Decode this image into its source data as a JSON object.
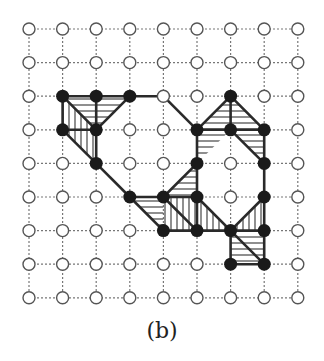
{
  "caption": "(b)",
  "grid": {
    "cols": 9,
    "rows": 9,
    "origin_x": 29,
    "origin_y": 29,
    "spacing": 33.6,
    "node_radius": 6.5
  },
  "colors": {
    "grid_line": "#777777",
    "open_node_stroke": "#555555",
    "filled_node": "#1a1a1a",
    "edge": "#2a2a2a",
    "hatch": "#333333"
  },
  "filled_nodes": [
    [
      1,
      2
    ],
    [
      2,
      2
    ],
    [
      3,
      2
    ],
    [
      6,
      2
    ],
    [
      1,
      3
    ],
    [
      2,
      3
    ],
    [
      5,
      3
    ],
    [
      6,
      3
    ],
    [
      7,
      3
    ],
    [
      2,
      4
    ],
    [
      5,
      4
    ],
    [
      7,
      4
    ],
    [
      3,
      5
    ],
    [
      4,
      5
    ],
    [
      5,
      5
    ],
    [
      7,
      5
    ],
    [
      4,
      6
    ],
    [
      5,
      6
    ],
    [
      6,
      6
    ],
    [
      7,
      6
    ],
    [
      6,
      7
    ],
    [
      7,
      7
    ]
  ],
  "edges": [
    [
      [
        1,
        2
      ],
      [
        2,
        2
      ]
    ],
    [
      [
        2,
        2
      ],
      [
        3,
        2
      ]
    ],
    [
      [
        3,
        2
      ],
      [
        4,
        2
      ]
    ],
    [
      [
        1,
        2
      ],
      [
        1,
        3
      ]
    ],
    [
      [
        2,
        2
      ],
      [
        2,
        3
      ]
    ],
    [
      [
        1,
        3
      ],
      [
        2,
        3
      ]
    ],
    [
      [
        2,
        3
      ],
      [
        2,
        4
      ]
    ],
    [
      [
        1,
        2
      ],
      [
        2,
        3
      ]
    ],
    [
      [
        3,
        2
      ],
      [
        2,
        3
      ]
    ],
    [
      [
        1,
        3
      ],
      [
        2,
        4
      ]
    ],
    [
      [
        4,
        2
      ],
      [
        5,
        3
      ]
    ],
    [
      [
        2,
        4
      ],
      [
        3,
        5
      ]
    ],
    [
      [
        5,
        3
      ],
      [
        6,
        2
      ]
    ],
    [
      [
        6,
        2
      ],
      [
        7,
        3
      ]
    ],
    [
      [
        6,
        2
      ],
      [
        6,
        3
      ]
    ],
    [
      [
        5,
        3
      ],
      [
        6,
        3
      ]
    ],
    [
      [
        6,
        3
      ],
      [
        7,
        3
      ]
    ],
    [
      [
        5,
        3
      ],
      [
        5,
        4
      ]
    ],
    [
      [
        6,
        3
      ],
      [
        7,
        4
      ]
    ],
    [
      [
        7,
        3
      ],
      [
        7,
        4
      ]
    ],
    [
      [
        5,
        4
      ],
      [
        4,
        5
      ]
    ],
    [
      [
        3,
        5
      ],
      [
        4,
        5
      ]
    ],
    [
      [
        4,
        5
      ],
      [
        5,
        5
      ]
    ],
    [
      [
        5,
        4
      ],
      [
        5,
        5
      ]
    ],
    [
      [
        3,
        5
      ],
      [
        4,
        6
      ]
    ],
    [
      [
        4,
        5
      ],
      [
        5,
        6
      ]
    ],
    [
      [
        4,
        6
      ],
      [
        5,
        6
      ]
    ],
    [
      [
        5,
        6
      ],
      [
        6,
        6
      ]
    ],
    [
      [
        5,
        5
      ],
      [
        6,
        6
      ]
    ],
    [
      [
        6,
        6
      ],
      [
        7,
        5
      ]
    ],
    [
      [
        7,
        4
      ],
      [
        7,
        5
      ]
    ],
    [
      [
        7,
        5
      ],
      [
        7,
        6
      ]
    ],
    [
      [
        6,
        6
      ],
      [
        7,
        6
      ]
    ],
    [
      [
        6,
        6
      ],
      [
        6,
        7
      ]
    ],
    [
      [
        6,
        6
      ],
      [
        7,
        7
      ]
    ],
    [
      [
        6,
        7
      ],
      [
        7,
        7
      ]
    ],
    [
      [
        7,
        6
      ],
      [
        7,
        7
      ]
    ],
    [
      [
        5,
        5
      ],
      [
        5,
        6
      ]
    ]
  ],
  "hatched_regions": [
    {
      "points": [
        [
          1,
          2
        ],
        [
          3,
          2
        ],
        [
          2,
          3
        ]
      ],
      "direction": "horizontal"
    },
    {
      "points": [
        [
          1,
          2
        ],
        [
          2,
          3
        ],
        [
          2,
          4
        ],
        [
          1,
          3
        ]
      ],
      "direction": "vertical"
    },
    {
      "points": [
        [
          6,
          2
        ],
        [
          5,
          3
        ],
        [
          6,
          3
        ]
      ],
      "direction": "horizontal"
    },
    {
      "points": [
        [
          6,
          2
        ],
        [
          6,
          3
        ],
        [
          7,
          3
        ]
      ],
      "direction": "horizontal"
    },
    {
      "points": [
        [
          5,
          3
        ],
        [
          6,
          3
        ],
        [
          5,
          4
        ]
      ],
      "direction": "horizontal"
    },
    {
      "points": [
        [
          6,
          3
        ],
        [
          7,
          3
        ],
        [
          7,
          4
        ]
      ],
      "direction": "horizontal"
    },
    {
      "points": [
        [
          5,
          4
        ],
        [
          5,
          5
        ],
        [
          4,
          5
        ]
      ],
      "direction": "horizontal"
    },
    {
      "points": [
        [
          3,
          5
        ],
        [
          4,
          5
        ],
        [
          4,
          6
        ]
      ],
      "direction": "horizontal"
    },
    {
      "points": [
        [
          4,
          5
        ],
        [
          5,
          5
        ],
        [
          5,
          6
        ],
        [
          4,
          6
        ]
      ],
      "direction": "vertical"
    },
    {
      "points": [
        [
          5,
          5
        ],
        [
          6,
          6
        ],
        [
          5,
          6
        ]
      ],
      "direction": "vertical"
    },
    {
      "points": [
        [
          6,
          6
        ],
        [
          7,
          5
        ],
        [
          7,
          6
        ]
      ],
      "direction": "vertical"
    },
    {
      "points": [
        [
          6,
          6
        ],
        [
          7,
          6
        ],
        [
          7,
          7
        ],
        [
          6,
          7
        ]
      ],
      "direction": "horizontal"
    }
  ]
}
